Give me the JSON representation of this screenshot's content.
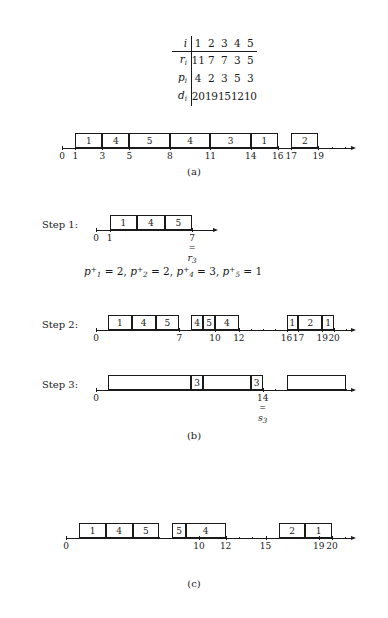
{
  "figure": {
    "table": {
      "rows": [
        {
          "head": "i",
          "head_sub": "",
          "values": [
            "1",
            "2",
            "3",
            "4",
            "5"
          ],
          "ruled": true
        },
        {
          "head": "r",
          "head_sub": "i",
          "values": [
            "11",
            "7",
            "7",
            "3",
            "5"
          ],
          "ruled": false
        },
        {
          "head": "p",
          "head_sub": "i",
          "values": [
            "4",
            "2",
            "3",
            "5",
            "3"
          ],
          "ruled": false
        },
        {
          "head": "d",
          "head_sub": "i",
          "values": [
            "20",
            "19",
            "15",
            "12",
            "10"
          ],
          "ruled": false
        }
      ]
    },
    "panel_a": {
      "caption": "(a)",
      "blocks": [
        {
          "label": "1",
          "start": 1,
          "end": 3
        },
        {
          "label": "4",
          "start": 3,
          "end": 5
        },
        {
          "label": "5",
          "start": 5,
          "end": 8
        },
        {
          "label": "4",
          "start": 8,
          "end": 11
        },
        {
          "label": "3",
          "start": 11,
          "end": 14
        },
        {
          "label": "1",
          "start": 14,
          "end": 16
        },
        {
          "label": "2",
          "start": 17,
          "end": 19
        }
      ],
      "ticks": [
        {
          "value": 0,
          "label": "0"
        },
        {
          "value": 1,
          "label": "1"
        },
        {
          "value": 3,
          "label": "3"
        },
        {
          "value": 5,
          "label": "5"
        },
        {
          "value": 8,
          "label": "8"
        },
        {
          "value": 11,
          "label": "11"
        },
        {
          "value": 14,
          "label": "14"
        },
        {
          "value": 16,
          "label": "16"
        },
        {
          "value": 17,
          "label": "17"
        },
        {
          "value": 19,
          "label": "19"
        }
      ],
      "minor_ticks": [
        2,
        4,
        6,
        7,
        9,
        10,
        12,
        13,
        15,
        18,
        20,
        21
      ]
    },
    "panel_b": {
      "caption": "(b)",
      "step1": {
        "label": "Step 1:",
        "blocks": [
          {
            "label": "1",
            "start": 1,
            "end": 3
          },
          {
            "label": "4",
            "start": 3,
            "end": 5
          },
          {
            "label": "5",
            "start": 5,
            "end": 7
          }
        ],
        "ticks": [
          {
            "value": 0,
            "label": "0"
          },
          {
            "value": 1,
            "label": "1"
          },
          {
            "value": 7,
            "label": "7"
          }
        ],
        "minor_ticks": [
          2,
          3,
          4,
          5,
          6
        ],
        "marker": {
          "at": 7,
          "equals": "=",
          "name": "r",
          "sub": "3"
        }
      },
      "formula": "p₁⁺ = 2,  p₂⁺ = 2,  p₄⁺ = 3,  p₅⁺ = 1",
      "formula_terms": [
        {
          "sym": "p",
          "sub": "1",
          "sup": "+",
          "value": "2"
        },
        {
          "sym": "p",
          "sub": "2",
          "sup": "+",
          "value": "2"
        },
        {
          "sym": "p",
          "sub": "4",
          "sup": "+",
          "value": "3"
        },
        {
          "sym": "p",
          "sub": "5",
          "sup": "+",
          "value": "1"
        }
      ],
      "step2": {
        "label": "Step 2:",
        "blocks": [
          {
            "label": "1",
            "start": 1,
            "end": 3
          },
          {
            "label": "4",
            "start": 3,
            "end": 5
          },
          {
            "label": "5",
            "start": 5,
            "end": 7
          },
          {
            "label": "4",
            "start": 8,
            "end": 9
          },
          {
            "label": "5",
            "start": 9,
            "end": 10
          },
          {
            "label": "4",
            "start": 10,
            "end": 12
          },
          {
            "label": "1",
            "start": 16,
            "end": 17
          },
          {
            "label": "2",
            "start": 17,
            "end": 19
          },
          {
            "label": "1",
            "start": 19,
            "end": 20
          }
        ],
        "ticks": [
          {
            "value": 0,
            "label": "0"
          },
          {
            "value": 7,
            "label": "7"
          },
          {
            "value": 10,
            "label": "10"
          },
          {
            "value": 12,
            "label": "12"
          },
          {
            "value": 16,
            "label": "16"
          },
          {
            "value": 17,
            "label": "17"
          },
          {
            "value": 19,
            "label": "19"
          },
          {
            "value": 20,
            "label": "20"
          }
        ],
        "minor_ticks": [
          1,
          2,
          3,
          4,
          5,
          6,
          8,
          9,
          11,
          13,
          14,
          15,
          18,
          21
        ]
      },
      "step3": {
        "label": "Step 3:",
        "blocks": [
          {
            "label": "",
            "start": 1,
            "end": 8
          },
          {
            "label": "3",
            "start": 8,
            "end": 9
          },
          {
            "label": "",
            "start": 9,
            "end": 13
          },
          {
            "label": "3",
            "start": 13,
            "end": 14
          },
          {
            "label": "",
            "start": 16,
            "end": 21
          }
        ],
        "ticks": [
          {
            "value": 0,
            "label": "0"
          },
          {
            "value": 14,
            "label": "14"
          }
        ],
        "minor_ticks": [
          1,
          2,
          3,
          4,
          5,
          6,
          7,
          8,
          9,
          10,
          11,
          12,
          13,
          15,
          16,
          17,
          18,
          19,
          20,
          21
        ],
        "marker": {
          "at": 14,
          "equals": "=",
          "name": "s",
          "sub": "3"
        }
      }
    },
    "panel_c": {
      "caption": "(c)",
      "blocks": [
        {
          "label": "1",
          "start": 1,
          "end": 3
        },
        {
          "label": "4",
          "start": 3,
          "end": 5
        },
        {
          "label": "5",
          "start": 5,
          "end": 7
        },
        {
          "label": "5",
          "start": 8,
          "end": 9
        },
        {
          "label": "4",
          "start": 9,
          "end": 12
        },
        {
          "label": "2",
          "start": 16,
          "end": 18
        },
        {
          "label": "1",
          "start": 18,
          "end": 20
        }
      ],
      "ticks": [
        {
          "value": 0,
          "label": "0"
        },
        {
          "value": 10,
          "label": "10"
        },
        {
          "value": 12,
          "label": "12"
        },
        {
          "value": 15,
          "label": "15"
        },
        {
          "value": 19,
          "label": "19"
        },
        {
          "value": 20,
          "label": "20"
        }
      ],
      "minor_ticks": [
        1,
        2,
        3,
        4,
        5,
        6,
        7,
        8,
        9,
        11,
        13,
        14,
        16,
        17,
        18,
        21
      ]
    }
  }
}
